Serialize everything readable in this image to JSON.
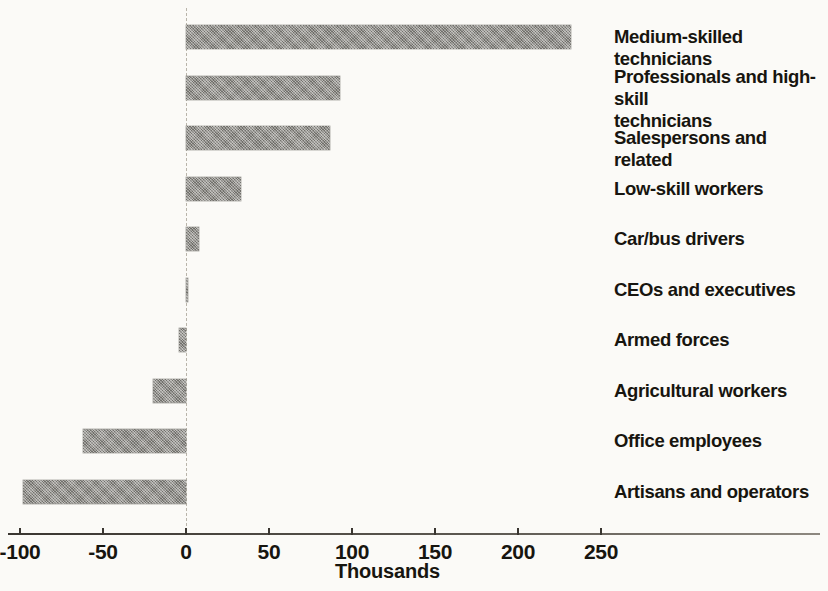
{
  "chart_data": {
    "type": "bar",
    "orientation": "horizontal",
    "title": "",
    "subtitle": "",
    "xlabel": "Thousands",
    "ylabel": "",
    "xlim": [
      -100,
      300
    ],
    "xticks": [
      -100,
      -50,
      0,
      50,
      100,
      150,
      200,
      250
    ],
    "xtick_labels": [
      "-100",
      "-50",
      "0",
      "50",
      "100",
      "150",
      "200",
      "250"
    ],
    "grid": false,
    "legend": null,
    "zero_reference_line": true,
    "units": "Thousands",
    "categories": [
      "Medium-skilled technicians",
      "Professionals and high-skill technicians",
      "Salespersons and related",
      "Low-skill workers",
      "Car/bus drivers",
      "CEOs and executives",
      "Armed forces",
      "Agricultural workers",
      "Office employees",
      "Artisans and operators"
    ],
    "values": [
      232,
      93,
      87,
      33,
      8,
      1.5,
      -4,
      -20,
      -62,
      -98
    ],
    "series": [
      {
        "name": "Change in employment",
        "color": "#8c8a84",
        "values": [
          232,
          93,
          87,
          33,
          8,
          1.5,
          -4,
          -20,
          -62,
          -98
        ]
      }
    ],
    "bars": [
      {
        "label": "Medium-skilled technicians",
        "value": 232,
        "label_lines": [
          "Medium-skilled technicians"
        ]
      },
      {
        "label": "Professionals and high-skill technicians",
        "value": 93,
        "label_lines": [
          "Professionals and high-skill",
          "technicians"
        ]
      },
      {
        "label": "Salespersons and related",
        "value": 87,
        "label_lines": [
          "Salespersons and related"
        ]
      },
      {
        "label": "Low-skill workers",
        "value": 33,
        "label_lines": [
          "Low-skill workers"
        ]
      },
      {
        "label": "Car/bus drivers",
        "value": 8,
        "label_lines": [
          "Car/bus drivers"
        ]
      },
      {
        "label": "CEOs and executives",
        "value": 1.5,
        "label_lines": [
          "CEOs and executives"
        ]
      },
      {
        "label": "Armed forces",
        "value": -4,
        "label_lines": [
          "Armed forces"
        ]
      },
      {
        "label": "Agricultural workers",
        "value": -20,
        "label_lines": [
          "Agricultural workers"
        ]
      },
      {
        "label": "Office employees",
        "value": -62,
        "label_lines": [
          "Office employees"
        ]
      },
      {
        "label": "Artisans and operators",
        "value": -98,
        "label_lines": [
          "Artisans and operators"
        ]
      }
    ],
    "colors": {
      "bar_fill": "#8c8a84",
      "axis": "#3a3631",
      "text": "#17150f",
      "background": "#fbfaf7",
      "zero_line": "#b9b4aa"
    }
  }
}
